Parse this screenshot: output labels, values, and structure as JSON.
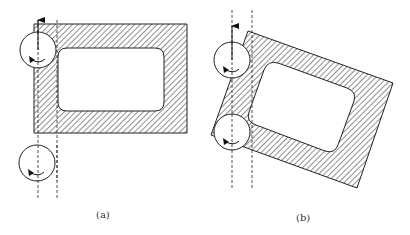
{
  "figure": {
    "panels": [
      {
        "id": "a",
        "label": "(a)",
        "description": "Axis-aligned hatched rectangular frame with rounded inner opening; two rotating cutter circles along vertical dashed tool paths on the left edge",
        "outer_rect": {
          "x": 34,
          "y": 24,
          "w": 153,
          "h": 109
        },
        "inner_rect": {
          "x": 58,
          "y": 48,
          "w": 106,
          "h": 63,
          "r": 9
        },
        "dashed_lines_x": [
          38,
          57
        ],
        "dashed_lines_y": [
          20,
          200
        ],
        "circles": [
          {
            "cx": 38,
            "cy": 50,
            "r": 18
          },
          {
            "cx": 37,
            "cy": 163,
            "r": 18
          }
        ],
        "arrow": {
          "x": 38,
          "y_from": 50,
          "y_to": 18
        }
      },
      {
        "id": "b",
        "label": "(b)",
        "description": "Rotated hatched rectangular frame with rounded inner opening; two rotating cutter circles along vertical dashed tool paths",
        "dashed_lines_x": [
          232,
          252
        ],
        "dashed_lines_y": [
          10,
          190
        ],
        "circles": [
          {
            "cx": 232,
            "cy": 60,
            "r": 18
          },
          {
            "cx": 232,
            "cy": 132,
            "r": 18
          }
        ],
        "arrow": {
          "x": 232,
          "y_from": 60,
          "y_to": 25
        }
      }
    ],
    "colors": {
      "stroke": "#222222",
      "hatch": "#333333",
      "background": "#ffffff"
    }
  }
}
